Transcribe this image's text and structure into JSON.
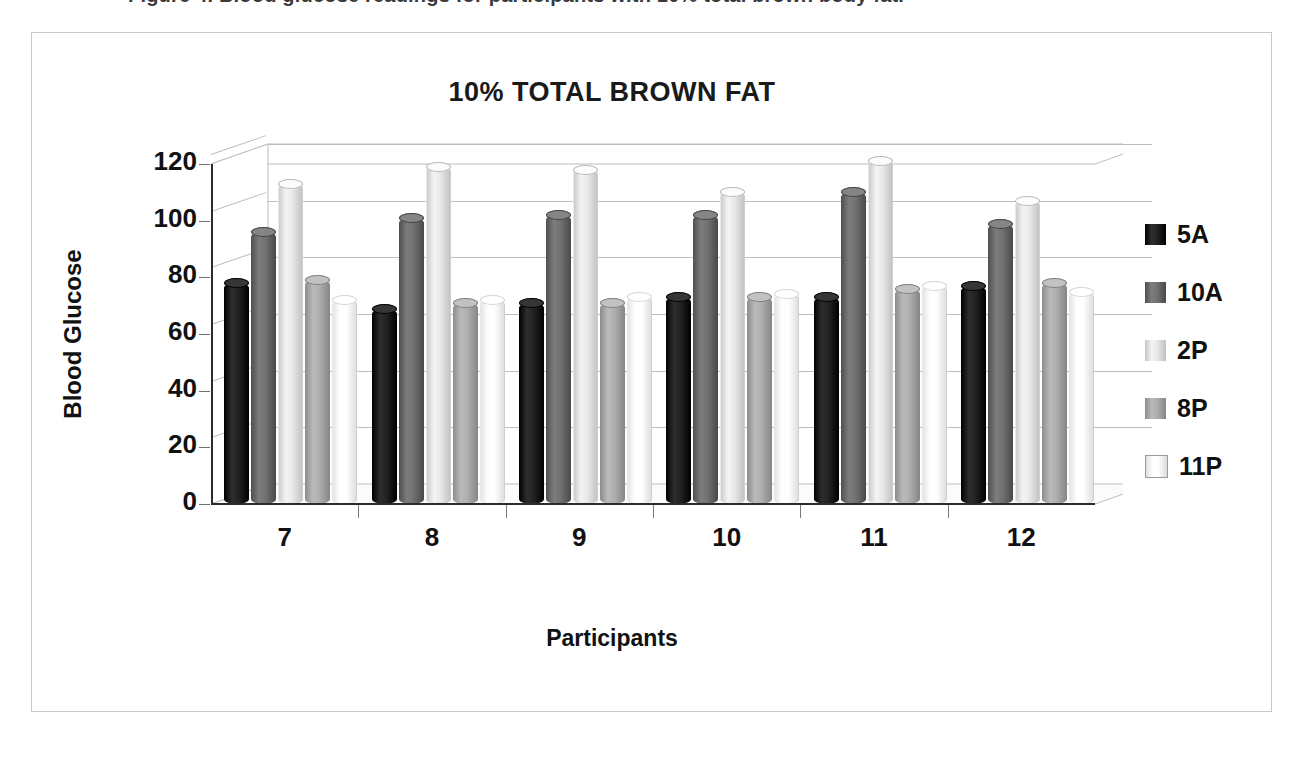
{
  "caption": {
    "text": "Figure 4. Blood glucose readings for participants with 10% total brown body fat."
  },
  "figure": {
    "title": "10% TOTAL BROWN FAT"
  },
  "legend": {
    "position": "right",
    "items": [
      {
        "label": "5A",
        "color": "#1c1c1c"
      },
      {
        "label": "10A",
        "color": "#6b6b6b"
      },
      {
        "label": "2P",
        "color": "#e2e2e2"
      },
      {
        "label": "8P",
        "color": "#a8a8a8"
      },
      {
        "label": "11P",
        "color": "#fdfdfd"
      }
    ]
  },
  "axes": {
    "x_title": "Participants",
    "y_title": "Blood Glucose",
    "y_ticks": [
      "120",
      "100",
      "80",
      "60",
      "40",
      "20",
      "0"
    ],
    "x_ticks": [
      "7",
      "8",
      "9",
      "10",
      "11",
      "12"
    ]
  },
  "chart_data": {
    "type": "bar",
    "title": "10% TOTAL BROWN FAT",
    "xlabel": "Participants",
    "ylabel": "Blood Glucose",
    "ylim": [
      0,
      120
    ],
    "ytick_step": 20,
    "grid": true,
    "legend_position": "right",
    "style": "3d-cylinder-clustered",
    "categories": [
      "7",
      "8",
      "9",
      "10",
      "11",
      "12"
    ],
    "series": [
      {
        "name": "5A",
        "color": "#1c1c1c",
        "values": [
          78,
          69,
          71,
          73,
          73,
          77
        ]
      },
      {
        "name": "10A",
        "color": "#6b6b6b",
        "values": [
          96,
          101,
          102,
          102,
          110,
          99
        ]
      },
      {
        "name": "2P",
        "color": "#e2e2e2",
        "values": [
          113,
          119,
          118,
          110,
          121,
          107
        ]
      },
      {
        "name": "8P",
        "color": "#a8a8a8",
        "values": [
          79,
          71,
          71,
          73,
          76,
          78
        ]
      },
      {
        "name": "11P",
        "color": "#fdfdfd",
        "values": [
          72,
          72,
          73,
          74,
          77,
          75
        ]
      }
    ]
  }
}
